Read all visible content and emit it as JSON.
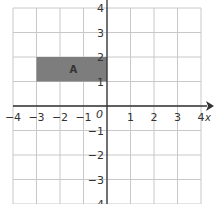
{
  "diagram": {
    "type": "coordinate-grid",
    "x_range": [
      -4,
      4
    ],
    "y_range": [
      -4,
      4
    ],
    "x_ticks": [
      "-4",
      "-3",
      "-2",
      "-1",
      "1",
      "2",
      "3",
      "4"
    ],
    "y_ticks": [
      "4",
      "3",
      "2",
      "1",
      "-1",
      "-2",
      "-3",
      "-4"
    ],
    "origin_label": "0",
    "x_axis_label": "x",
    "shape": {
      "label": "A",
      "vertices": [
        [
          -3,
          1
        ],
        [
          0,
          1
        ],
        [
          0,
          2
        ],
        [
          -3,
          2
        ]
      ],
      "fill": "#7d7d7d"
    },
    "colors": {
      "grid": "#c8c8c8",
      "axis": "#333333"
    }
  }
}
